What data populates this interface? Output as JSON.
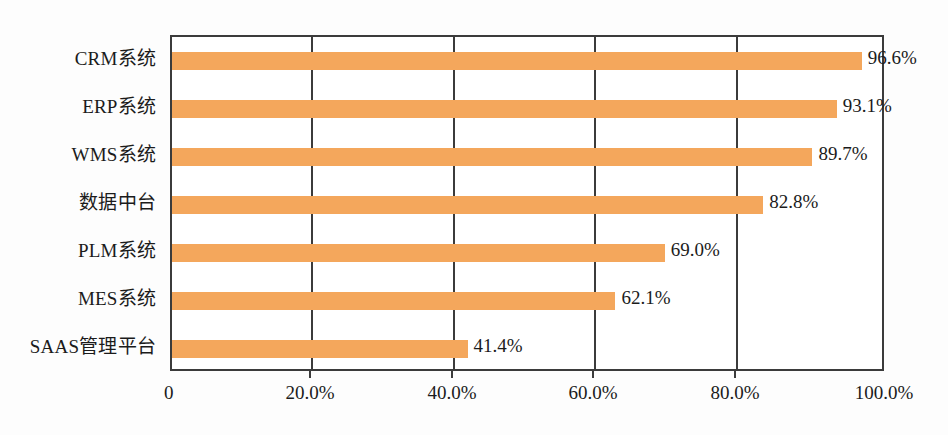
{
  "chart_data": {
    "type": "bar",
    "orientation": "horizontal",
    "title": "",
    "subtitle": "",
    "xlabel": "",
    "ylabel": "",
    "categories": [
      "CRM系统",
      "ERP系统",
      "WMS系统",
      "数据中台",
      "PLM系统",
      "MES系统",
      "SAAS管理平台"
    ],
    "values": [
      96.6,
      93.1,
      89.7,
      82.8,
      69.0,
      62.1,
      41.4
    ],
    "data_labels": [
      "96.6%",
      "93.1%",
      "89.7%",
      "82.8%",
      "69.0%",
      "62.1%",
      "41.4%"
    ],
    "xlim": [
      0,
      100
    ],
    "x_tick_values": [
      0,
      20,
      40,
      60,
      80,
      100
    ],
    "x_tick_labels": [
      "0",
      "20.0%",
      "40.0%",
      "60.0%",
      "80.0%",
      "100.0%"
    ],
    "grid": {
      "vertical": true,
      "horizontal": false
    },
    "legend": {
      "visible": false,
      "position": "none",
      "entries": []
    },
    "colors": {
      "bar": "#f4a75c",
      "axis": "#3b3b3b",
      "text": "#1b1b1b",
      "background": "#ffffff"
    },
    "annotations": []
  }
}
